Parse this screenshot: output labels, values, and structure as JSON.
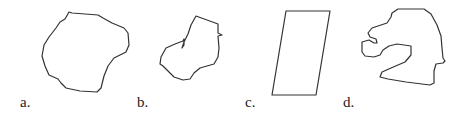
{
  "figure": {
    "panels": [
      {
        "label": "a.",
        "description": "closed irregular rounded blob outline"
      },
      {
        "label": "b.",
        "description": "irregular outline with inward notch, boot-like shape"
      },
      {
        "label": "c.",
        "description": "parallelogram outline"
      },
      {
        "label": "d.",
        "description": "irregular outline with deep concave inlets, head-like shape"
      }
    ],
    "stroke_color": "#333333",
    "background": "#ffffff"
  }
}
